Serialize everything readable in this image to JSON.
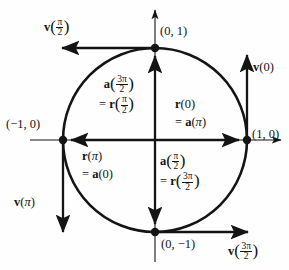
{
  "figure": {
    "type": "math-diagram",
    "width": 289,
    "height": 270,
    "colors": {
      "stroke": "#141414",
      "background": "#fefefe",
      "text": "#141414"
    }
  },
  "geometry": {
    "center": {
      "x": 155,
      "y": 140
    },
    "radius": 92,
    "axes": {
      "x_axis": {
        "y": 140,
        "x_start": 30,
        "x_end": 286
      },
      "y_axis": {
        "x": 155,
        "y_start": 6,
        "y_end": 262
      }
    },
    "circle_points": [
      {
        "name": "top",
        "x": 155,
        "y": 48,
        "label": "(0, 1)"
      },
      {
        "name": "right",
        "x": 247,
        "y": 140,
        "label": "(1, 0)"
      },
      {
        "name": "bottom",
        "x": 155,
        "y": 232,
        "label": "(0, -1)"
      },
      {
        "name": "left",
        "x": 63,
        "y": 140,
        "label": "(-1, 0)"
      }
    ]
  },
  "point_labels": {
    "top": "(0, 1)",
    "right": "(1, 0)",
    "bottom_prefix": "(0, ",
    "bottom_minus": "−",
    "bottom_suffix": "1)",
    "left_prefix": "(",
    "left_minus": "−",
    "left_suffix": "1, 0)"
  },
  "vectors": {
    "v_half_pi": {
      "name": "v(pi/2)",
      "bold_symbol": "v",
      "arg_numerator": "π",
      "arg_denominator": "2",
      "direction": "left",
      "from": {
        "x": 155,
        "y": 48
      },
      "to": {
        "x": 57,
        "y": 48
      }
    },
    "v_zero": {
      "name": "v(0)",
      "bold_symbol": "v",
      "arg": "0",
      "direction": "up",
      "from": {
        "x": 247,
        "y": 140
      },
      "to": {
        "x": 247,
        "y": 50
      }
    },
    "v_pi": {
      "name": "v(pi)",
      "bold_symbol": "v",
      "arg": "π",
      "direction": "down",
      "from": {
        "x": 63,
        "y": 140
      },
      "to": {
        "x": 63,
        "y": 237
      }
    },
    "v_three_half_pi": {
      "name": "v(3pi/2)",
      "bold_symbol": "v",
      "arg_numerator": "3π",
      "arg_denominator": "2",
      "direction": "right",
      "from": {
        "x": 155,
        "y": 232
      },
      "to": {
        "x": 253,
        "y": 232
      }
    },
    "up_axis_vector": {
      "name": "a(3pi/2) = r(pi/2)",
      "direction": "up",
      "from": {
        "x": 155,
        "y": 140
      },
      "to": {
        "x": 155,
        "y": 52
      }
    },
    "down_axis_vector": {
      "name": "a(pi/2) = r(3pi/2)",
      "direction": "down",
      "from": {
        "x": 155,
        "y": 140
      },
      "to": {
        "x": 155,
        "y": 228
      }
    },
    "left_axis_vector": {
      "name": "r(pi) = a(0)",
      "direction": "left",
      "from": {
        "x": 155,
        "y": 140
      },
      "to": {
        "x": 67,
        "y": 140
      }
    },
    "right_axis_vector": {
      "name": "r(0) = a(pi)",
      "direction": "right",
      "from": {
        "x": 155,
        "y": 140
      },
      "to": {
        "x": 243,
        "y": 140
      }
    }
  },
  "interior_labels": {
    "upper_left": {
      "line1_symbol": "a",
      "line1_num": "3π",
      "line1_den": "2",
      "line2_eq": "=",
      "line2_symbol": "r",
      "line2_num": "π",
      "line2_den": "2"
    },
    "upper_right": {
      "line1_symbol": "r",
      "line1_arg": "0",
      "line2_eq": "=",
      "line2_symbol": "a",
      "line2_arg": "π"
    },
    "lower_left": {
      "line1_symbol": "r",
      "line1_arg": "π",
      "line2_eq": "=",
      "line2_symbol": "a",
      "line2_arg": "0"
    },
    "lower_right": {
      "line1_symbol": "a",
      "line1_num": "π",
      "line1_den": "2",
      "line2_eq": "=",
      "line2_symbol": "r",
      "line2_num": "3π",
      "line2_den": "2"
    }
  }
}
